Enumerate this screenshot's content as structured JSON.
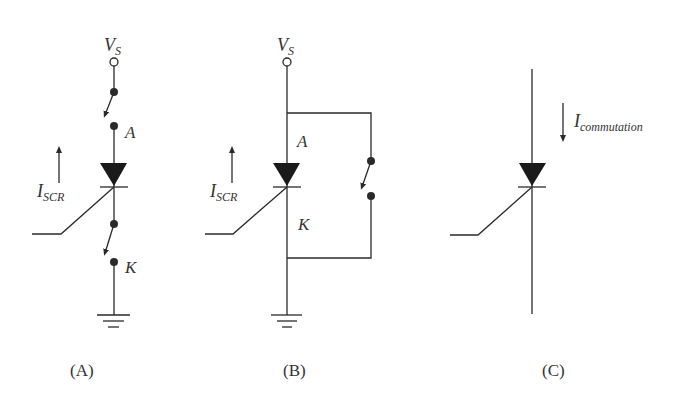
{
  "panels": [
    {
      "id": "A",
      "caption": "(A)",
      "supply_label": {
        "main": "V",
        "sub": "S"
      },
      "anode_label": "A",
      "cathode_label": "K",
      "current_label": {
        "main": "I",
        "sub": "SCR"
      },
      "current_direction": "up",
      "switches": [
        "anode-side switch (open)",
        "cathode-side switch (open)"
      ]
    },
    {
      "id": "B",
      "caption": "(B)",
      "supply_label": {
        "main": "V",
        "sub": "S"
      },
      "anode_label": "A",
      "cathode_label": "K",
      "current_label": {
        "main": "I",
        "sub": "SCR"
      },
      "current_direction": "up",
      "switches": [
        "parallel bypass switch (open)"
      ]
    },
    {
      "id": "C",
      "caption": "(C)",
      "current_label": {
        "main": "I",
        "sub": "commutation"
      },
      "current_direction": "down"
    }
  ],
  "colors": {
    "ink": "#2a2a2a",
    "background": "#ffffff"
  }
}
